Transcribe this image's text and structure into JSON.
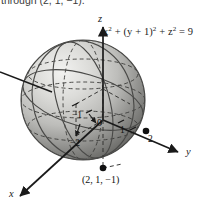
{
  "caption": {
    "clipped_line": "through (2, 1, −1)."
  },
  "figure": {
    "equation_label": "x2 + (y + 1)2 + z2 = 9",
    "equation_parts": {
      "x": "x",
      "exp1": "2",
      "plus1": " + (",
      "y": "y",
      "plus_one": " + 1)",
      "exp2": "2",
      "plus2": " + ",
      "z": "z",
      "exp3": "2",
      "equals": " = 9"
    },
    "axes": [
      {
        "name": "z",
        "direction": "up"
      },
      {
        "name": "y",
        "direction": "right-down"
      },
      {
        "name": "x",
        "direction": "left-down"
      }
    ],
    "tick_labels": [
      {
        "text": "−1",
        "axis": "y"
      },
      {
        "text": "0",
        "axis": "origin"
      },
      {
        "text": "1",
        "axis": "y"
      },
      {
        "text": "2",
        "axis": "y"
      },
      {
        "text": "−2",
        "axis": "x"
      }
    ],
    "points": [
      {
        "label": "(2, 1, −1)",
        "marker": "filled-dot"
      },
      {
        "label": "",
        "marker": "filled-dot-on-y-axis"
      }
    ],
    "sphere": {
      "radius_note": "3",
      "fill_light": "#e8e8e6",
      "fill_mid": "#b9b9b6",
      "fill_dark": "#6d6d6a",
      "outline": "#4a4a48"
    },
    "colors": {
      "axis": "#1a1a1a",
      "grid_dashed": "#3c3c3a",
      "text": "#111111",
      "background": "#ffffff"
    }
  }
}
